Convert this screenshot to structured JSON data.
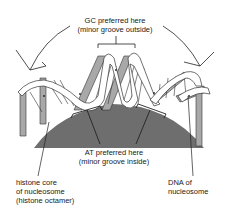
{
  "diagram": {
    "type": "nucleosome-dna-schematic",
    "colors": {
      "histone_core": "#6e6e6e",
      "dna_ribbon_front": "#ffffff",
      "dna_ribbon_back": "#a8a8a8",
      "line": "#333333",
      "background": "#ffffff"
    },
    "labels": {
      "gc": {
        "line1": "GC preferred here",
        "line2": "(minor groove outside)"
      },
      "at": {
        "line1": "AT preferred here",
        "line2": "(minor groove inside)"
      },
      "histone": {
        "line1": "histone core",
        "line2": "of nucleosome",
        "line3": "(histone octamer)"
      },
      "dna": {
        "line1": "DNA of",
        "line2": "nucleosome"
      }
    }
  }
}
